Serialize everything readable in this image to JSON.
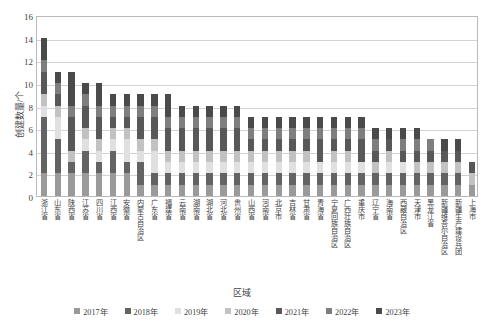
{
  "chart_data": {
    "type": "bar",
    "stacked": true,
    "title": "",
    "xlabel": "区域",
    "ylabel": "创建数量/个",
    "ylim": [
      0,
      16
    ],
    "yticks": [
      0,
      2,
      4,
      6,
      8,
      10,
      12,
      14,
      16
    ],
    "grid": true,
    "legend_position": "bottom",
    "categories": [
      "浙江省",
      "山东省",
      "陕西省",
      "江苏省",
      "四川省",
      "江西省",
      "安徽省",
      "内蒙古自治区",
      "广东省",
      "福建省",
      "云南省",
      "湖南省",
      "湖北省",
      "河北省",
      "贵州省",
      "山西省",
      "河南省",
      "北京市",
      "吉林省",
      "甘肃省",
      "青海省",
      "宁夏回族自治区",
      "广西壮族自治区",
      "重庆市",
      "辽宁省",
      "海南省",
      "西藏自治区",
      "天津市",
      "黑龙江省",
      "新疆维吾尔自治区",
      "新疆生产建设兵团",
      "上海市"
    ],
    "series": [
      {
        "name": "2017年",
        "color": "#9a9a9a",
        "values": [
          2,
          2,
          2,
          2,
          2,
          2,
          2,
          1,
          1,
          1,
          1,
          1,
          1,
          1,
          1,
          1,
          1,
          1,
          1,
          1,
          1,
          1,
          1,
          1,
          1,
          1,
          1,
          1,
          1,
          1,
          1,
          1
        ]
      },
      {
        "name": "2018年",
        "color": "#636363",
        "values": [
          5,
          3,
          1,
          2,
          1,
          2,
          1,
          2,
          1,
          1,
          1,
          1,
          1,
          1,
          1,
          1,
          1,
          1,
          1,
          1,
          1,
          1,
          1,
          1,
          1,
          1,
          1,
          1,
          1,
          1,
          1,
          0
        ]
      },
      {
        "name": "2019年",
        "color": "#e0e0e0",
        "values": [
          1,
          2,
          0,
          1,
          1,
          1,
          2,
          1,
          2,
          1,
          1,
          1,
          1,
          1,
          1,
          1,
          1,
          1,
          1,
          1,
          1,
          1,
          1,
          1,
          0,
          1,
          1,
          0,
          0,
          0,
          0,
          0
        ]
      },
      {
        "name": "2020年",
        "color": "#c2c2c2",
        "values": [
          1,
          1,
          1,
          1,
          1,
          1,
          1,
          1,
          1,
          1,
          1,
          1,
          1,
          1,
          1,
          1,
          1,
          1,
          1,
          1,
          0,
          1,
          1,
          0,
          1,
          1,
          0,
          1,
          1,
          1,
          1,
          1
        ]
      },
      {
        "name": "2021年",
        "color": "#585858",
        "values": [
          2,
          1,
          3,
          2,
          2,
          1,
          1,
          2,
          2,
          2,
          2,
          2,
          2,
          2,
          2,
          1,
          1,
          1,
          1,
          1,
          2,
          1,
          1,
          2,
          1,
          1,
          1,
          1,
          1,
          1,
          1,
          1
        ]
      },
      {
        "name": "2022年",
        "color": "#7e7e7e",
        "values": [
          1,
          1,
          1,
          1,
          1,
          1,
          1,
          1,
          1,
          1,
          1,
          1,
          1,
          1,
          1,
          1,
          1,
          1,
          1,
          1,
          1,
          1,
          1,
          1,
          1,
          0,
          1,
          1,
          1,
          0,
          0,
          0
        ]
      },
      {
        "name": "2023年",
        "color": "#4a4a4a",
        "values": [
          2,
          1,
          3,
          1,
          2,
          1,
          1,
          1,
          1,
          2,
          1,
          1,
          1,
          1,
          1,
          1,
          1,
          1,
          1,
          1,
          1,
          1,
          1,
          1,
          1,
          1,
          1,
          1,
          0,
          1,
          1,
          0
        ]
      }
    ],
    "totals": [
      14,
      11,
      11,
      10,
      10,
      9,
      9,
      9,
      9,
      9,
      8,
      8,
      8,
      8,
      8,
      7,
      7,
      7,
      7,
      7,
      7,
      7,
      7,
      7,
      6,
      6,
      6,
      6,
      5,
      5,
      5,
      3
    ]
  },
  "caption": ""
}
